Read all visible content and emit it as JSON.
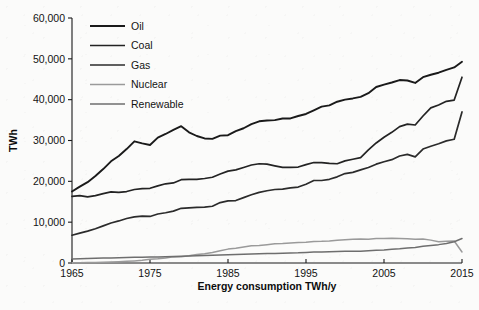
{
  "chart_data": {
    "type": "line",
    "title": "",
    "xlabel": "Energy consumption TWh/y",
    "ylabel": "TWh",
    "xlim": [
      1965,
      2015
    ],
    "ylim": [
      0,
      60000
    ],
    "grid": false,
    "legend_position": "top-left-inside",
    "x_tick_labels": [
      "1965",
      "1975",
      "1985",
      "1995",
      "2005",
      "2015"
    ],
    "x_ticks": [
      1965,
      1975,
      1985,
      1995,
      2005,
      2015
    ],
    "y_tick_labels": [
      "0",
      "10,000",
      "20,000",
      "30,000",
      "40,000",
      "50,000",
      "60,000"
    ],
    "y_ticks": [
      0,
      10000,
      20000,
      30000,
      40000,
      50000,
      60000
    ],
    "x": [
      1965,
      1966,
      1967,
      1968,
      1969,
      1970,
      1971,
      1972,
      1973,
      1974,
      1975,
      1976,
      1977,
      1978,
      1979,
      1980,
      1981,
      1982,
      1983,
      1984,
      1985,
      1986,
      1987,
      1988,
      1989,
      1990,
      1991,
      1992,
      1993,
      1994,
      1995,
      1996,
      1997,
      1998,
      1999,
      2000,
      2001,
      2002,
      2003,
      2004,
      2005,
      2006,
      2007,
      2008,
      2009,
      2010,
      2011,
      2012,
      2013,
      2014,
      2015
    ],
    "series": [
      {
        "name": "Oil",
        "color": "#1a1a1a",
        "width": 1.9,
        "values": [
          17500,
          18700,
          19800,
          21300,
          23000,
          24900,
          26200,
          27900,
          29800,
          29300,
          28900,
          30700,
          31600,
          32600,
          33500,
          32000,
          31100,
          30500,
          30400,
          31200,
          31300,
          32300,
          33000,
          34000,
          34700,
          34900,
          35000,
          35400,
          35400,
          36000,
          36500,
          37400,
          38300,
          38600,
          39500,
          40000,
          40300,
          40700,
          41600,
          43100,
          43700,
          44200,
          44800,
          44700,
          44100,
          45500,
          46100,
          46600,
          47300,
          47900,
          49300
        ],
        "marker": "none"
      },
      {
        "name": "Coal",
        "color": "#232323",
        "width": 1.7,
        "values": [
          16300,
          16500,
          16200,
          16500,
          17000,
          17400,
          17300,
          17500,
          18000,
          18200,
          18300,
          18900,
          19400,
          19600,
          20400,
          20500,
          20500,
          20700,
          21000,
          21800,
          22500,
          22800,
          23400,
          24000,
          24300,
          24200,
          23800,
          23400,
          23400,
          23500,
          24100,
          24600,
          24600,
          24400,
          24300,
          25000,
          25400,
          25800,
          27700,
          29400,
          30800,
          32000,
          33400,
          34000,
          33800,
          36000,
          38000,
          38700,
          39600,
          39900,
          45500
        ],
        "marker": "none"
      },
      {
        "name": "Gas",
        "color": "#2b2b2b",
        "width": 1.7,
        "values": [
          6800,
          7300,
          7800,
          8400,
          9100,
          9800,
          10300,
          10900,
          11300,
          11500,
          11400,
          12000,
          12300,
          12700,
          13400,
          13500,
          13600,
          13700,
          13900,
          14800,
          15200,
          15300,
          16000,
          16700,
          17300,
          17700,
          18000,
          18100,
          18400,
          18600,
          19300,
          20200,
          20200,
          20500,
          21100,
          21900,
          22200,
          22800,
          23400,
          24200,
          24800,
          25300,
          26200,
          26600,
          26000,
          27900,
          28600,
          29200,
          29900,
          30300,
          37000
        ],
        "marker": "none"
      },
      {
        "name": "Nuclear",
        "color": "#9a9a9a",
        "width": 1.5,
        "values": [
          70,
          90,
          120,
          150,
          200,
          250,
          320,
          420,
          520,
          650,
          900,
          1050,
          1250,
          1500,
          1550,
          1800,
          2100,
          2250,
          2550,
          3000,
          3400,
          3600,
          3900,
          4200,
          4300,
          4500,
          4700,
          4750,
          4900,
          5000,
          5100,
          5250,
          5300,
          5400,
          5600,
          5700,
          5800,
          5850,
          5800,
          6000,
          6000,
          6050,
          6000,
          5950,
          5800,
          5900,
          5600,
          5200,
          5300,
          5400,
          2700
        ],
        "marker": "none"
      },
      {
        "name": "Renewable",
        "color": "#6e6e6e",
        "width": 1.5,
        "values": [
          1000,
          1050,
          1100,
          1150,
          1200,
          1250,
          1300,
          1350,
          1380,
          1420,
          1480,
          1500,
          1560,
          1620,
          1680,
          1700,
          1760,
          1820,
          1900,
          1980,
          2050,
          2100,
          2150,
          2220,
          2250,
          2300,
          2350,
          2380,
          2450,
          2500,
          2600,
          2700,
          2720,
          2780,
          2820,
          2900,
          2850,
          2900,
          3000,
          3100,
          3200,
          3350,
          3500,
          3700,
          3800,
          4100,
          4300,
          4500,
          4800,
          5200,
          6000
        ],
        "marker": "none"
      }
    ]
  },
  "legend": {
    "entries": [
      {
        "label": "Oil"
      },
      {
        "label": "Coal"
      },
      {
        "label": "Gas"
      },
      {
        "label": "Nuclear"
      },
      {
        "label": "Renewable"
      }
    ]
  },
  "axes": {
    "x_title": "Energy consumption TWh/y",
    "y_title": "TWh"
  }
}
